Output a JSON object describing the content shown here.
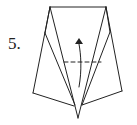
{
  "step": {
    "label": "5."
  },
  "diagram": {
    "stroke_color": "#222222",
    "background": "#ffffff"
  }
}
